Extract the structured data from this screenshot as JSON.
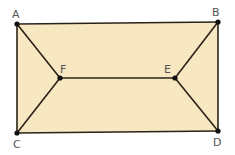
{
  "diagram": {
    "title": "",
    "fill_color": "#f8e8c2",
    "stroke_color": "#2a2218",
    "points": [
      {
        "name": "A",
        "x": 17,
        "y": 24
      },
      {
        "name": "B",
        "x": 218,
        "y": 22
      },
      {
        "name": "C",
        "x": 17,
        "y": 133
      },
      {
        "name": "D",
        "x": 218,
        "y": 131
      },
      {
        "name": "E",
        "x": 175,
        "y": 78
      },
      {
        "name": "F",
        "x": 60,
        "y": 78
      }
    ],
    "edges": [
      [
        "A",
        "B"
      ],
      [
        "B",
        "D"
      ],
      [
        "D",
        "C"
      ],
      [
        "C",
        "A"
      ],
      [
        "A",
        "F"
      ],
      [
        "C",
        "F"
      ],
      [
        "F",
        "E"
      ],
      [
        "E",
        "B"
      ],
      [
        "E",
        "D"
      ]
    ],
    "labels": {
      "A": "A",
      "B": "B",
      "C": "C",
      "D": "D",
      "E": "E",
      "F": "F"
    }
  }
}
